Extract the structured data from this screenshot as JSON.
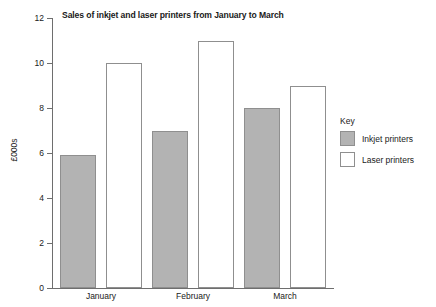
{
  "chart_data": {
    "type": "bar",
    "title": "Sales of inkjet and laser printers from January to March",
    "xlabel": "",
    "ylabel": "£000s",
    "ylim": [
      0,
      12
    ],
    "yticks": [
      0,
      2,
      4,
      6,
      8,
      10,
      12
    ],
    "grid": false,
    "categories": [
      "January",
      "February",
      "March"
    ],
    "series": [
      {
        "name": "Inkjet printers",
        "values": [
          5.9,
          7,
          8
        ],
        "color": "#b3b3b3"
      },
      {
        "name": "Laser printers",
        "values": [
          10,
          11,
          9
        ],
        "color": "#ffffff"
      }
    ],
    "legend": {
      "title": "Key",
      "position": "right",
      "entries": [
        {
          "label": "Inkjet printers",
          "color": "#b3b3b3"
        },
        {
          "label": "Laser printers",
          "color": "#ffffff"
        }
      ]
    }
  },
  "axis": {
    "tick_labels": [
      "12",
      "10",
      "8",
      "6",
      "4",
      "2",
      "0"
    ]
  }
}
